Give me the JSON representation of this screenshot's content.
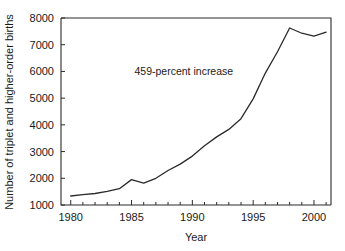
{
  "chart_data": {
    "type": "line",
    "title": "",
    "xlabel": "Year",
    "ylabel": "Number of triplet and higher-order births",
    "xlim": [
      1979.2,
      2001.4
    ],
    "ylim": [
      1000,
      8000
    ],
    "grid": false,
    "legend": null,
    "annotations": [
      {
        "text": "459-percent increase",
        "x": 1989.3,
        "y": 5850
      }
    ],
    "x_ticks_major": [
      1980,
      1985,
      1990,
      1995,
      2000
    ],
    "x_tick_labels": [
      "1980",
      "1985",
      "1990",
      "1995",
      "2000"
    ],
    "x_ticks_minor": [
      1981,
      1982,
      1983,
      1984,
      1986,
      1987,
      1988,
      1989,
      1991,
      1992,
      1993,
      1994,
      1996,
      1997,
      1998,
      1999,
      2001
    ],
    "y_ticks": [
      1000,
      2000,
      3000,
      4000,
      5000,
      6000,
      7000,
      8000
    ],
    "y_tick_labels": [
      "1000",
      "2000",
      "3000",
      "4000",
      "5000",
      "6000",
      "7000",
      "8000"
    ],
    "x": [
      1980,
      1981,
      1982,
      1983,
      1984,
      1985,
      1986,
      1987,
      1988,
      1989,
      1990,
      1991,
      1992,
      1993,
      1994,
      1995,
      1996,
      1997,
      1998,
      1999,
      2000,
      2001
    ],
    "values": [
      1337,
      1385,
      1430,
      1510,
      1610,
      1950,
      1820,
      2000,
      2290,
      2530,
      2830,
      3220,
      3550,
      3830,
      4230,
      4973,
      5939,
      6737,
      7625,
      7430,
      7325,
      7471
    ],
    "series": [
      {
        "name": "Triplet and higher-order births",
        "values": [
          1337,
          1385,
          1430,
          1510,
          1610,
          1950,
          1820,
          2000,
          2290,
          2530,
          2830,
          3220,
          3550,
          3830,
          4230,
          4973,
          5939,
          6737,
          7625,
          7430,
          7325,
          7471
        ]
      }
    ],
    "line_color": "#2b2b2b",
    "background_color": "#ffffff"
  }
}
